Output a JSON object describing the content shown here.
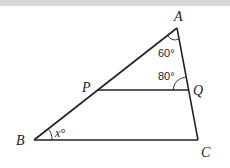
{
  "diagram": {
    "points": {
      "A": {
        "label": "A",
        "x": 177,
        "y": 28
      },
      "B": {
        "label": "B",
        "x": 34,
        "y": 140
      },
      "C": {
        "label": "C",
        "x": 198,
        "y": 140
      },
      "P": {
        "label": "P",
        "x": 97,
        "y": 90
      },
      "Q": {
        "label": "Q",
        "x": 188,
        "y": 90
      }
    },
    "segments": [
      "AB",
      "AC",
      "BC",
      "PQ"
    ],
    "angles": {
      "A": {
        "label": "60°",
        "value": 60
      },
      "AQP": {
        "label": "80°",
        "value": 80
      },
      "B": {
        "label": "x°",
        "variable": "x"
      }
    },
    "colors": {
      "line": "#222222",
      "background": "#ffffff",
      "top_band": "#d8d8d8"
    }
  }
}
